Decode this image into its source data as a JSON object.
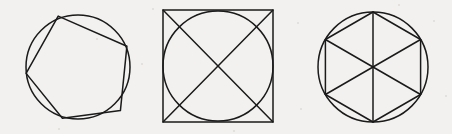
{
  "sheet": {
    "title": "Inscribed polygon figures",
    "width": 452,
    "height": 134,
    "background_color": "#f3f1ef",
    "ink_color": "#1a1a1a",
    "figure_count": 3,
    "caption": ""
  },
  "figures": [
    {
      "id": "pentagon-in-circle",
      "name": "Regular pentagon inscribed in a circle",
      "shape_label": "pentagon",
      "sides": 5,
      "circle": {
        "cx": 78,
        "cy": 67,
        "r": 52
      },
      "rotation_deg": -20,
      "has_diagonals": false,
      "vertices": [
        {
          "x": 58.2,
          "y": 16.1
        },
        {
          "x": 126.9,
          "y": 46.2
        },
        {
          "x": 120.4,
          "y": 110.6
        },
        {
          "x": 62.4,
          "y": 118.3
        },
        {
          "x": 26.1,
          "y": 73.4
        }
      ]
    },
    {
      "id": "circle-in-square",
      "name": "Circle inscribed in a square with both diagonals drawn",
      "shape_label": "square",
      "sides": 4,
      "square": {
        "x": 163,
        "y": 10,
        "width": 110,
        "height": 112
      },
      "circle": {
        "cx": 218,
        "cy": 66,
        "r": 55
      },
      "has_diagonals": true,
      "diagonals": [
        {
          "x1": 163,
          "y1": 10,
          "x2": 273,
          "y2": 122
        },
        {
          "x1": 273,
          "y1": 10,
          "x2": 163,
          "y2": 122
        }
      ],
      "vertices": [
        {
          "x": 163,
          "y": 10
        },
        {
          "x": 273,
          "y": 10
        },
        {
          "x": 273,
          "y": 122
        },
        {
          "x": 163,
          "y": 122
        }
      ]
    },
    {
      "id": "hexagon-in-circle",
      "name": "Regular hexagon inscribed in a circle with three long diagonals",
      "shape_label": "hexagon",
      "sides": 6,
      "circle": {
        "cx": 373,
        "cy": 67,
        "r": 55
      },
      "rotation_deg": 0,
      "orientation": "pointy-top",
      "has_diagonals": true,
      "vertices": [
        {
          "x": 373.0,
          "y": 12.0
        },
        {
          "x": 420.6,
          "y": 39.5
        },
        {
          "x": 420.6,
          "y": 94.5
        },
        {
          "x": 373.0,
          "y": 122.0
        },
        {
          "x": 325.4,
          "y": 94.5
        },
        {
          "x": 325.4,
          "y": 39.5
        }
      ],
      "diagonals": [
        {
          "x1": 373.0,
          "y1": 12.0,
          "x2": 373.0,
          "y2": 122.0
        },
        {
          "x1": 420.6,
          "y1": 39.5,
          "x2": 325.4,
          "y2": 94.5
        },
        {
          "x1": 420.6,
          "y1": 94.5,
          "x2": 325.4,
          "y2": 39.5
        }
      ],
      "triangle_count": 6
    }
  ],
  "paper_marks": [
    {
      "x": 96,
      "y": 38,
      "size": 2
    },
    {
      "x": 141,
      "y": 63,
      "size": 2
    },
    {
      "x": 152,
      "y": 8,
      "size": 2
    },
    {
      "x": 297,
      "y": 22,
      "size": 2
    },
    {
      "x": 300,
      "y": 108,
      "size": 2
    },
    {
      "x": 433,
      "y": 20,
      "size": 2
    },
    {
      "x": 445,
      "y": 95,
      "size": 2
    },
    {
      "x": 58,
      "y": 128,
      "size": 2
    },
    {
      "x": 233,
      "y": 130,
      "size": 2
    },
    {
      "x": 398,
      "y": 4,
      "size": 2
    }
  ]
}
